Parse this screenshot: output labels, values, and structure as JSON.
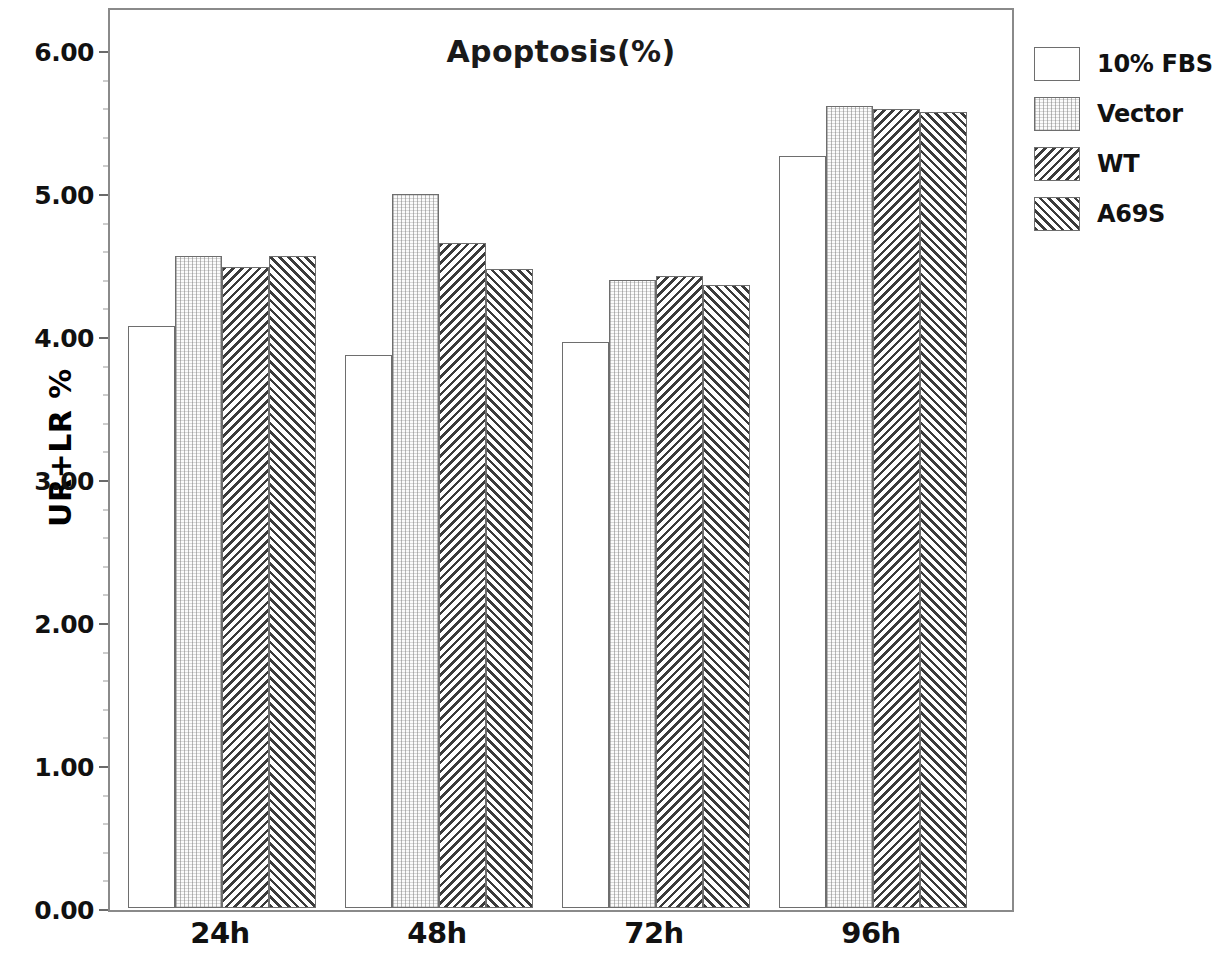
{
  "chart_data": {
    "type": "bar",
    "title": "Apoptosis(%)",
    "xlabel": "",
    "ylabel": "UR+LR %",
    "categories": [
      "24h",
      "48h",
      "72h",
      "96h"
    ],
    "ylim": [
      0,
      6
    ],
    "ytick_labels": [
      "0.00",
      "1.00",
      "2.00",
      "3.00",
      "4.00",
      "5.00",
      "6.00"
    ],
    "ytick_values": [
      0,
      1,
      2,
      3,
      4,
      5,
      6
    ],
    "grid": false,
    "legend_position": "right",
    "series": [
      {
        "name": "10% FBS",
        "pattern": "empty",
        "values": [
          4.07,
          3.87,
          3.96,
          5.26
        ]
      },
      {
        "name": "Vector",
        "pattern": "dots",
        "values": [
          4.56,
          4.99,
          4.39,
          5.61
        ]
      },
      {
        "name": "WT",
        "pattern": "hatch-back",
        "values": [
          4.48,
          4.65,
          4.42,
          5.59
        ]
      },
      {
        "name": "A69S",
        "pattern": "hatch-fwd",
        "values": [
          4.56,
          4.47,
          4.36,
          5.57
        ]
      }
    ]
  },
  "legend": {
    "items": [
      {
        "label": "10% FBS",
        "pattern": "empty"
      },
      {
        "label": "Vector",
        "pattern": "dots"
      },
      {
        "label": "WT",
        "pattern": "hatch-back"
      },
      {
        "label": "A69S",
        "pattern": "hatch-fwd"
      }
    ]
  },
  "colors": {
    "frame": "#8a8a8a",
    "bar_edge": "#6e6e6e",
    "hatch": "#3b3b3b",
    "text": "#111111"
  }
}
